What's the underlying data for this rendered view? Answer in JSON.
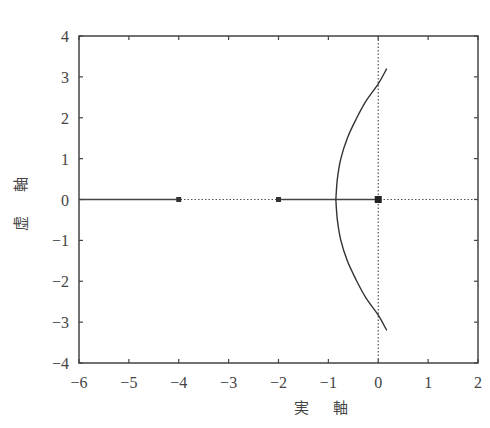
{
  "chart_data": {
    "type": "line",
    "title": "",
    "xlabel": "実 軸",
    "ylabel": "虚 軸",
    "xlim": [
      -6,
      2
    ],
    "ylim": [
      -4,
      4
    ],
    "x_ticks": [
      -6,
      -5,
      -4,
      -3,
      -2,
      -1,
      0,
      1,
      2
    ],
    "y_ticks": [
      -4,
      -3,
      -2,
      -1,
      0,
      1,
      2,
      3,
      4
    ],
    "x_tick_labels": [
      "−6",
      "−5",
      "−4",
      "−3",
      "−2",
      "−1",
      "0",
      "1",
      "2"
    ],
    "y_tick_labels": [
      "−4",
      "−3",
      "−2",
      "−1",
      "0",
      "1",
      "2",
      "3",
      "4"
    ],
    "grid": false,
    "reference_lines": [
      {
        "orientation": "horizontal",
        "value": 0,
        "style": "dotted"
      },
      {
        "orientation": "vertical",
        "value": 0,
        "style": "dotted"
      }
    ],
    "poles": [
      {
        "re": 0,
        "im": 0
      },
      {
        "re": -2,
        "im": 0
      },
      {
        "re": -4,
        "im": 0
      }
    ],
    "series": [
      {
        "name": "root-locus-branch-left",
        "x": [
          -6,
          -4
        ],
        "y": [
          0,
          0
        ],
        "style": "solid"
      },
      {
        "name": "root-locus-segment-real",
        "x": [
          -2,
          0
        ],
        "y": [
          0,
          0
        ],
        "style": "solid"
      },
      {
        "name": "root-locus-branch-upper",
        "x": [
          -0.85,
          -0.82,
          -0.75,
          -0.62,
          -0.45,
          -0.25,
          0,
          0.17
        ],
        "y": [
          0,
          0.5,
          1.0,
          1.5,
          1.95,
          2.4,
          2.83,
          3.2
        ],
        "style": "solid"
      },
      {
        "name": "root-locus-branch-lower",
        "x": [
          -0.85,
          -0.82,
          -0.75,
          -0.62,
          -0.45,
          -0.25,
          0,
          0.17
        ],
        "y": [
          0,
          -0.5,
          -1.0,
          -1.5,
          -1.95,
          -2.4,
          -2.83,
          -3.2
        ],
        "style": "solid"
      }
    ],
    "annotations": {
      "breakaway_point": -0.85,
      "imag_axis_crossing": 2.83
    }
  },
  "labels": {
    "xlabel": "実 軸",
    "ylabel": "虚 軸"
  }
}
